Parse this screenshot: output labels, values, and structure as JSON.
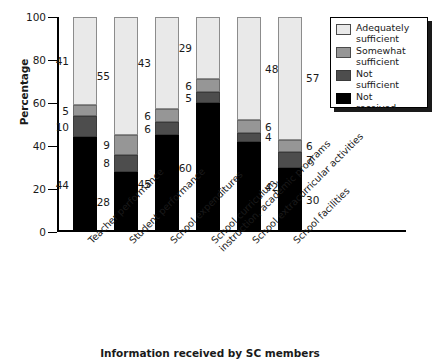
{
  "chart_data": {
    "type": "bar",
    "subtype": "stacked-bar-100-percent",
    "title": "",
    "xlabel": "Information received by SC members",
    "ylabel": "Percentage",
    "ylim": [
      0,
      100
    ],
    "yticks": [
      0,
      20,
      40,
      60,
      80,
      100
    ],
    "grid": false,
    "legend_position": "top-right",
    "categories": [
      "Teacher performance",
      "Student performance",
      "School expenditures",
      "School curriculum, instruction, academic programs",
      "School extracurricular activities",
      "School facilities"
    ],
    "category_lines": [
      [
        "Teacher performance"
      ],
      [
        "Student performance"
      ],
      [
        "School expenditures"
      ],
      [
        "School curriculum,",
        "instruction, academic programs"
      ],
      [
        "School extracurricular activities"
      ],
      [
        "School facilities"
      ]
    ],
    "series": [
      {
        "name": "Not received",
        "color": "#000000",
        "values": [
          44,
          28,
          45,
          60,
          42,
          30
        ]
      },
      {
        "name": "Not sufficient",
        "color": "#4d4d4d",
        "values": [
          10,
          8,
          6,
          5,
          4,
          7
        ]
      },
      {
        "name": "Somewhat sufficient",
        "color": "#969696",
        "values": [
          5,
          9,
          6,
          6,
          6,
          6
        ]
      },
      {
        "name": "Adequately sufficient",
        "color": "#e9e9e9",
        "values": [
          41,
          55,
          43,
          29,
          48,
          57
        ]
      }
    ],
    "legend_entries": [
      {
        "label_line1": "Adequately",
        "label_line2": "sufficient",
        "color": "#e9e9e9"
      },
      {
        "label_line1": "Somewhat",
        "label_line2": "sufficient",
        "color": "#969696"
      },
      {
        "label_line1": "Not",
        "label_line2": "sufficient",
        "color": "#4d4d4d"
      },
      {
        "label_line1": "Not",
        "label_line2": "received",
        "color": "#000000"
      }
    ]
  },
  "axis": {
    "y_title": "Percentage",
    "x_title": "Information received by SC members",
    "y_tick_labels": [
      "100",
      "80",
      "60",
      "40",
      "20",
      "0"
    ]
  }
}
